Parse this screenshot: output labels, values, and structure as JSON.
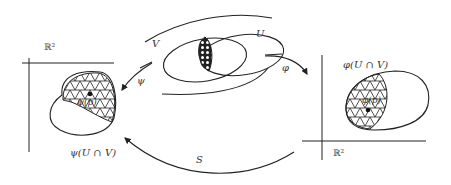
{
  "diagram": {
    "labels": {
      "V": "V",
      "U": "U",
      "psi": "ψ",
      "phi": "φ",
      "S": "S",
      "R2_left": "ℝ²",
      "R2_right": "ℝ²",
      "psi_p": "ψ(p)",
      "phi_p": "φ(p)",
      "psi_UV": "ψ(U ∩ V)",
      "phi_UV": "φ(U ∩ V)"
    },
    "colors": {
      "stroke": "#222222",
      "text": "#333333",
      "background": "#ffffff"
    }
  }
}
